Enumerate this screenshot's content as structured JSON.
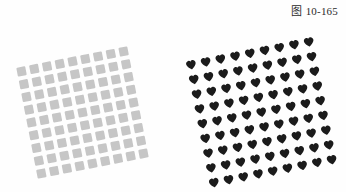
{
  "figure": {
    "label": "图 10-165",
    "background_color": "#fefefe",
    "label_color": "#2b2b2b"
  },
  "panels": [
    {
      "id": "squares",
      "motif": "square-icon",
      "motif_name": "gray square",
      "color": "#c6c6c6",
      "rotation_deg": -11,
      "rows": 9,
      "columns": 9,
      "cell_size": 13,
      "motif_size": 8.5,
      "offset_x": -4,
      "offset_y": 4
    },
    {
      "id": "hearts",
      "motif": "heart-icon",
      "motif_name": "black heart",
      "color": "#1b1b1b",
      "rotation_deg": -11,
      "rows": 9,
      "columns": 9,
      "cell_size": 15,
      "motif_size": 11,
      "offset_x": 2,
      "offset_y": 6
    }
  ]
}
